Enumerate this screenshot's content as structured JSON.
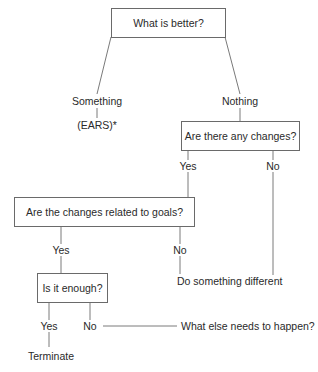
{
  "diagram": {
    "root": {
      "text": "What is better?"
    },
    "branch_something": {
      "label": "Something",
      "child": "(EARS)*"
    },
    "branch_nothing": {
      "label": "Nothing"
    },
    "changes_question": {
      "text": "Are there any changes?",
      "yes": "Yes",
      "no": "No"
    },
    "goals_question": {
      "text": "Are the changes related to goals?",
      "yes": "Yes",
      "no": "No"
    },
    "different_action": {
      "text": "Do something different"
    },
    "enough_question": {
      "text": "Is it enough?",
      "yes": "Yes",
      "no": "No"
    },
    "terminate": {
      "text": "Terminate"
    },
    "what_else": {
      "text": "What else needs to happen?"
    }
  },
  "colors": {
    "line": "#7a7a7a",
    "border": "#6a6a6a",
    "text": "#2a2a2a",
    "background": "#ffffff"
  }
}
